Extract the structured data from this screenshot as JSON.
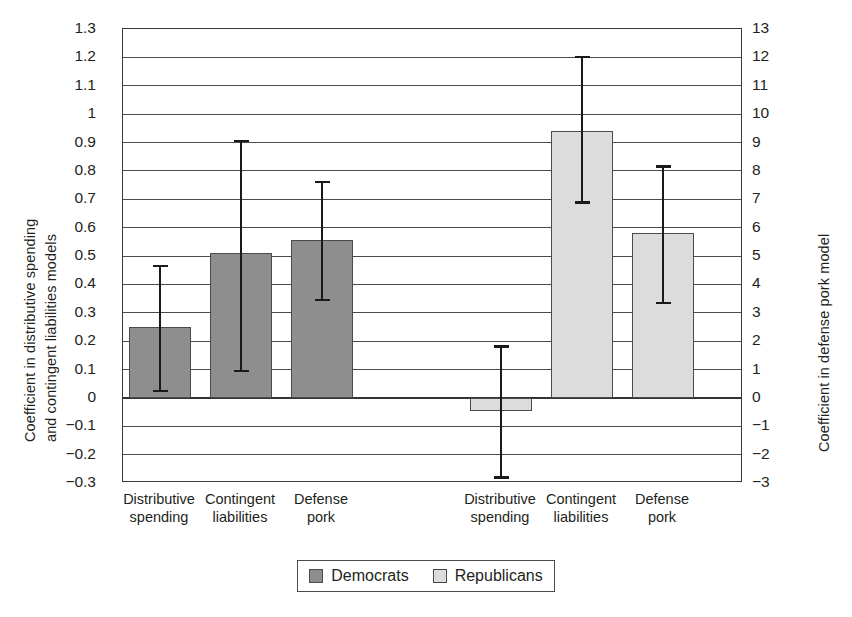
{
  "chart_data": {
    "type": "bar",
    "title": "",
    "grid": true,
    "legend_position": "bottom",
    "categories": [
      "Distributive spending",
      "Contingent liabilities",
      "Defense pork"
    ],
    "axes": {
      "left": {
        "label_line1": "Coefficient in distributive spending",
        "label_line2": "and contingent liabilities models",
        "lim": [
          -0.3,
          1.3
        ],
        "tick_step": 0.1,
        "ticks": [
          "1.3",
          "1.2",
          "1.1",
          "1",
          "0.9",
          "0.8",
          "0.7",
          "0.6",
          "0.5",
          "0.4",
          "0.3",
          "0.2",
          "0.1",
          "0",
          "−0.1",
          "−0.2",
          "−0.3"
        ],
        "tick_values": [
          1.3,
          1.2,
          1.1,
          1.0,
          0.9,
          0.8,
          0.7,
          0.6,
          0.5,
          0.4,
          0.3,
          0.2,
          0.1,
          0,
          -0.1,
          -0.2,
          -0.3
        ]
      },
      "right": {
        "label": "Coefficient in defense pork model",
        "lim": [
          -3,
          13
        ],
        "tick_step": 1,
        "ticks": [
          "13",
          "12",
          "11",
          "10",
          "9",
          "8",
          "7",
          "6",
          "5",
          "4",
          "3",
          "2",
          "1",
          "0",
          "−1",
          "−2",
          "−3"
        ],
        "tick_values": [
          13,
          12,
          11,
          10,
          9,
          8,
          7,
          6,
          5,
          4,
          3,
          2,
          1,
          0,
          -1,
          -2,
          -3
        ]
      }
    },
    "series": [
      {
        "name": "Democrats",
        "color": "#8e8e8e",
        "axis": "left",
        "points": [
          {
            "category": "Distributive spending",
            "label_line1": "Distributive",
            "label_line2": "spending",
            "value": 0.25,
            "ci_low": 0.02,
            "ci_high": 0.47
          },
          {
            "category": "Contingent liabilities",
            "label_line1": "Contingent",
            "label_line2": "liabilities",
            "value": 0.51,
            "ci_low": 0.09,
            "ci_high": 0.91
          },
          {
            "category": "Defense pork",
            "label_line1": "Defense",
            "label_line2": "pork",
            "value": 0.555,
            "ci_low": 0.34,
            "ci_high": 0.765
          }
        ]
      },
      {
        "name": "Republicans",
        "color": "#dcdcdc",
        "axis": "right",
        "points": [
          {
            "category": "Distributive spending",
            "label_line1": "Distributive",
            "label_line2": "spending",
            "value": -0.45,
            "ci_low": -2.85,
            "ci_high": 1.85
          },
          {
            "category": "Contingent liabilities",
            "label_line1": "Contingent",
            "label_line2": "liabilities",
            "value": 9.4,
            "ci_low": 6.85,
            "ci_high": 12.05
          },
          {
            "category": "Defense pork",
            "label_line1": "Defense",
            "label_line2": "pork",
            "value": 5.8,
            "ci_low": 3.3,
            "ci_high": 8.2
          }
        ]
      }
    ],
    "legend": [
      {
        "label": "Democrats",
        "color": "#8e8e8e"
      },
      {
        "label": "Republicans",
        "color": "#dcdcdc"
      }
    ]
  }
}
